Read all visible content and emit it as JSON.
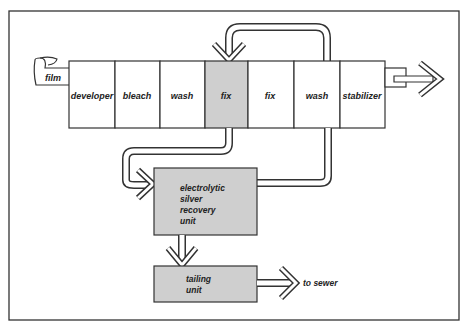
{
  "diagram": {
    "input_label": "film",
    "tanks": [
      {
        "label": "developer",
        "highlighted": false
      },
      {
        "label": "bleach",
        "highlighted": false
      },
      {
        "label": "wash",
        "highlighted": false
      },
      {
        "label": "fix",
        "highlighted": true
      },
      {
        "label": "fix",
        "highlighted": false
      },
      {
        "label": "wash",
        "highlighted": false
      },
      {
        "label": "stabilizer",
        "highlighted": false
      }
    ],
    "recovery_unit": {
      "line1": "electrolytic",
      "line2": "silver",
      "line3": "recovery",
      "line4": "unit"
    },
    "tailing_unit": {
      "line1": "tailing",
      "line2": "unit"
    },
    "output_label": "to sewer"
  },
  "colors": {
    "highlight_fill": "#cfcfcf",
    "line": "#333333",
    "background": "#ffffff"
  }
}
